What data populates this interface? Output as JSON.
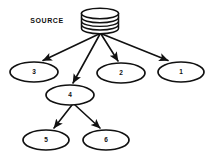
{
  "diagram": {
    "type": "tree",
    "title": "",
    "background_color": "#ffffff",
    "line_color": "#111111",
    "node_fill": "#ffffff",
    "source": {
      "label": "SOURCE",
      "icon": "database-cylinder-icon",
      "cx": 100,
      "cy": 21,
      "width": 37,
      "height": 23,
      "rib_count": 4,
      "label_x": 47,
      "label_y": 21
    },
    "nodes": [
      {
        "id": "n3",
        "label": "3",
        "cx": 34,
        "cy": 72,
        "rx": 24,
        "ry": 10
      },
      {
        "id": "n2",
        "label": "2",
        "cx": 121,
        "cy": 73,
        "rx": 24,
        "ry": 10
      },
      {
        "id": "n1",
        "label": "1",
        "cx": 181,
        "cy": 72,
        "rx": 23,
        "ry": 10
      },
      {
        "id": "n4",
        "label": "4",
        "cx": 70,
        "cy": 95,
        "rx": 24,
        "ry": 10
      },
      {
        "id": "n5",
        "label": "5",
        "cx": 46,
        "cy": 140,
        "rx": 23,
        "ry": 10
      },
      {
        "id": "n6",
        "label": "6",
        "cx": 106,
        "cy": 140,
        "rx": 23,
        "ry": 10
      }
    ],
    "edges": [
      {
        "id": "e-source-3",
        "from": "source",
        "to": "n3",
        "x1": 99,
        "y1": 34,
        "x2": 41,
        "y2": 61,
        "arrow": true
      },
      {
        "id": "e-source-4",
        "from": "source",
        "to": "n4",
        "x1": 100,
        "y1": 34,
        "x2": 73,
        "y2": 84,
        "arrow": true
      },
      {
        "id": "e-source-2",
        "from": "source",
        "to": "n2",
        "x1": 101,
        "y1": 34,
        "x2": 118,
        "y2": 62,
        "arrow": true
      },
      {
        "id": "e-source-1",
        "from": "source",
        "to": "n1",
        "x1": 102,
        "y1": 34,
        "x2": 167,
        "y2": 61,
        "arrow": true
      },
      {
        "id": "e-4-5",
        "from": "n4",
        "to": "n5",
        "x1": 72,
        "y1": 105,
        "x2": 53,
        "y2": 129,
        "arrow": true
      },
      {
        "id": "e-4-6",
        "from": "n4",
        "to": "n6",
        "x1": 75,
        "y1": 105,
        "x2": 101,
        "y2": 129,
        "arrow": true
      }
    ]
  }
}
